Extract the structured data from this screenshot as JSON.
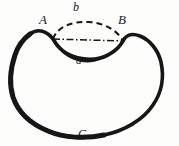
{
  "figure": {
    "background_color": "#fdfdfc",
    "ink_color": "#161616",
    "labels": {
      "vertex_left": "A",
      "vertex_right": "B",
      "arc_upper": "b",
      "arc_lower": "a",
      "outer_curve": "C"
    },
    "strokes": {
      "outer_curve_style": "solid",
      "arc_lower_style": "solid",
      "arc_upper_style": "dashed",
      "chord_style": "dash-dot",
      "outer_curve_width_px": 4,
      "arc_lower_width_px": 3,
      "arc_upper_width_px": 2,
      "chord_width_px": 1.4
    },
    "points": {
      "A": {
        "x": 53,
        "y": 39
      },
      "B": {
        "x": 123,
        "y": 41
      }
    }
  }
}
